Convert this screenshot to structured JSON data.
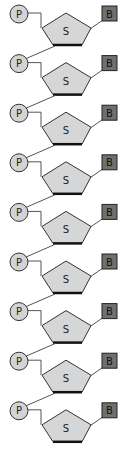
{
  "diagram": {
    "unit_count": 9,
    "period_px": 49.6,
    "labels": {
      "phosphate": "P",
      "sugar": "S",
      "base": "B"
    },
    "colors": {
      "phosphate_fill": "#d3d3d3",
      "sugar_fill": "#d6d6d6",
      "base_fill": "#707070",
      "stroke": "#333333",
      "line": "#555555"
    },
    "units": [
      {
        "index": 1,
        "phosphate": "P",
        "sugar": "S",
        "base": "B"
      },
      {
        "index": 2,
        "phosphate": "P",
        "sugar": "S",
        "base": "B"
      },
      {
        "index": 3,
        "phosphate": "P",
        "sugar": "S",
        "base": "B"
      },
      {
        "index": 4,
        "phosphate": "P",
        "sugar": "S",
        "base": "B"
      },
      {
        "index": 5,
        "phosphate": "P",
        "sugar": "S",
        "base": "B"
      },
      {
        "index": 6,
        "phosphate": "P",
        "sugar": "S",
        "base": "B"
      },
      {
        "index": 7,
        "phosphate": "P",
        "sugar": "S",
        "base": "B"
      },
      {
        "index": 8,
        "phosphate": "P",
        "sugar": "S",
        "base": "B"
      },
      {
        "index": 9,
        "phosphate": "P",
        "sugar": "S",
        "base": "B"
      }
    ]
  }
}
